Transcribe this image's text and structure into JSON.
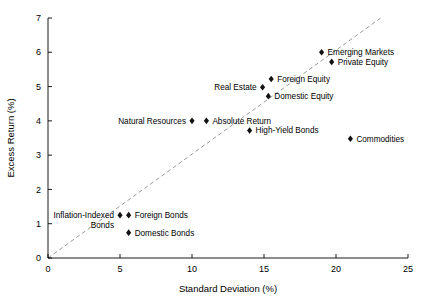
{
  "chart_data": {
    "type": "scatter",
    "title": "",
    "xlabel": "Standard Deviation (%)",
    "ylabel": "Excess Return (%)",
    "xlim": [
      0,
      25
    ],
    "ylim": [
      0,
      7
    ],
    "xticks": [
      0,
      5,
      10,
      15,
      20,
      25
    ],
    "yticks": [
      0,
      1,
      2,
      3,
      4,
      5,
      6,
      7
    ],
    "grid": false,
    "legend": "none",
    "trendline": {
      "style": "dashed",
      "color": "#8c8c8c",
      "x": [
        0,
        23.1
      ],
      "y": [
        0,
        7
      ]
    },
    "points": [
      {
        "name": "Emerging Markets",
        "x": 19.0,
        "y": 6.0,
        "label": "Emerging Markets",
        "label_side": "right"
      },
      {
        "name": "Private Equity",
        "x": 19.7,
        "y": 5.72,
        "label": "Private Equity",
        "label_side": "right"
      },
      {
        "name": "Foreign Equity",
        "x": 15.5,
        "y": 5.22,
        "label": "Foreign Equity",
        "label_side": "right"
      },
      {
        "name": "Real Estate",
        "x": 14.9,
        "y": 4.98,
        "label": "Real Estate",
        "label_side": "left"
      },
      {
        "name": "Domestic Equity",
        "x": 15.3,
        "y": 4.72,
        "label": "Domestic Equity",
        "label_side": "right"
      },
      {
        "name": "Natural Resources",
        "x": 10.0,
        "y": 4.0,
        "label": "Natural Resources",
        "label_side": "left"
      },
      {
        "name": "Absolute Return",
        "x": 11.0,
        "y": 4.0,
        "label": "Absolute Return",
        "label_side": "right"
      },
      {
        "name": "High-Yield Bonds",
        "x": 14.0,
        "y": 3.72,
        "label": "High-Yield Bonds",
        "label_side": "right"
      },
      {
        "name": "Commodities",
        "x": 21.0,
        "y": 3.48,
        "label": "Commodities",
        "label_side": "right"
      },
      {
        "name": "Inflation-Indexed Bonds",
        "x": 5.0,
        "y": 1.25,
        "label": "",
        "label_side": "none"
      },
      {
        "name": "Foreign Bonds",
        "x": 5.6,
        "y": 1.25,
        "label": "Foreign Bonds",
        "label_side": "right"
      },
      {
        "name": "Domestic Bonds",
        "x": 5.6,
        "y": 0.74,
        "label": "Domestic Bonds",
        "label_side": "right"
      }
    ],
    "multiline_labels": [
      {
        "name": "Inflation-Indexed Bonds",
        "lines": [
          "Inflation-Indexed",
          "Bonds"
        ],
        "x": 5.0,
        "y": 1.25
      }
    ]
  },
  "axes": {
    "x_title": "Standard Deviation (%)",
    "y_title": "Excess Return (%)",
    "x_tick_labels": [
      "0",
      "5",
      "10",
      "15",
      "20",
      "25"
    ],
    "y_tick_labels": [
      "0",
      "1",
      "2",
      "3",
      "4",
      "5",
      "6",
      "7"
    ]
  },
  "colors": {
    "marker": "#111111",
    "trendline": "#8c8c8c",
    "axis": "#000000",
    "background": "#ffffff"
  }
}
